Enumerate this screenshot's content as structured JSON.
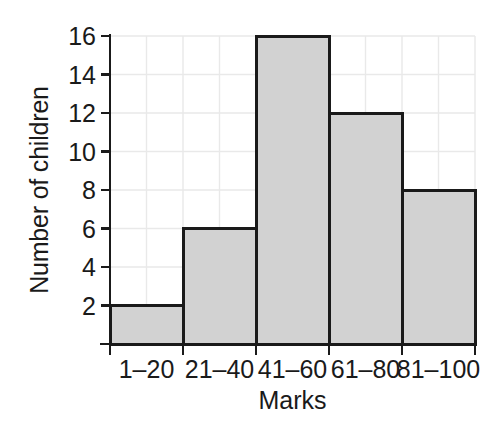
{
  "chart_data": {
    "type": "bar",
    "title": "",
    "subtitle": "",
    "xlabel": "Marks",
    "ylabel": "Number of children",
    "categories": [
      "1–20",
      "21–40",
      "41–60",
      "61–80",
      "81–100"
    ],
    "values": [
      2,
      6,
      16,
      12,
      8
    ],
    "series": [
      {
        "name": "Number of children",
        "values": [
          2,
          6,
          16,
          12,
          8
        ]
      }
    ],
    "ylim": [
      0,
      16
    ],
    "xlim": [
      0,
      5
    ],
    "y_ticks": [
      2,
      4,
      6,
      8,
      10,
      12,
      14,
      16
    ],
    "y_tick_labels": [
      "2",
      "4",
      "6",
      "8",
      "10",
      "12",
      "14",
      "16"
    ],
    "grid": true,
    "grid_major_horizontal": true,
    "grid_minor_vertical": true,
    "legend": false,
    "legend_position": "none",
    "annotations": [],
    "style": {
      "bar_fill": "#d2d2d2",
      "bar_stroke": "#1a1a1a",
      "bar_stroke_width": 3,
      "grid_color": "#e9e9e9",
      "axis_color": "#1a1a1a",
      "background": "#ffffff",
      "text_color": "#1a1a1a"
    }
  },
  "axis": {
    "x_title": "Marks",
    "y_title": "Number of children"
  }
}
